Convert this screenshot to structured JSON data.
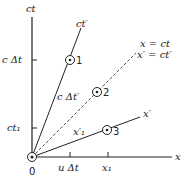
{
  "axes": {
    "ct": "ct",
    "x": "x",
    "ct_prime": "ct′",
    "x_prime": "x′",
    "origin": "0"
  },
  "light_line": {
    "line1": "x = ct",
    "line2": "x′ = ct′"
  },
  "ticks": {
    "c_dt": "c Δt",
    "ct1": "ct₁",
    "u_dt": "u Δt",
    "x1": "x₁"
  },
  "line_labels": {
    "c_dt_prime": "c Δt′",
    "x_prime_1": "x′₁"
  },
  "events": [
    {
      "label": "1"
    },
    {
      "label": "2"
    },
    {
      "label": "3"
    }
  ]
}
